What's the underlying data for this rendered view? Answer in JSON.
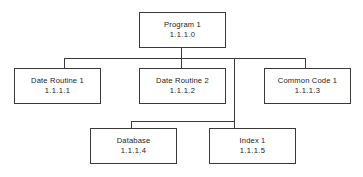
{
  "diagram": {
    "kind": "hierarchy-structure-chart",
    "orientation": "top-down",
    "line_color": "#3a3a3a",
    "box_fill": "#ffffff",
    "background": "#ffffff",
    "nodes": [
      {
        "id": "program-1",
        "title": "Program 1",
        "code": "1.1.1.0",
        "level": 1
      },
      {
        "id": "date-routine-1",
        "title": "Date Routine 1",
        "code": "1.1.1.1",
        "level": 2
      },
      {
        "id": "date-routine-2",
        "title": "Date Routine 2",
        "code": "1.1.1.2",
        "level": 2
      },
      {
        "id": "common-code-1",
        "title": "Common Code 1",
        "code": "1.1.1.3",
        "level": 2
      },
      {
        "id": "database",
        "title": "Database",
        "code": "1.1.1.4",
        "level": 3
      },
      {
        "id": "index-1",
        "title": "Index 1",
        "code": "1.1.1.5",
        "level": 3
      }
    ],
    "edges": [
      {
        "from": "program-1",
        "to": "date-routine-1"
      },
      {
        "from": "program-1",
        "to": "date-routine-2"
      },
      {
        "from": "program-1",
        "to": "common-code-1"
      },
      {
        "from": "program-1",
        "to": "database"
      },
      {
        "from": "program-1",
        "to": "index-1"
      }
    ]
  }
}
